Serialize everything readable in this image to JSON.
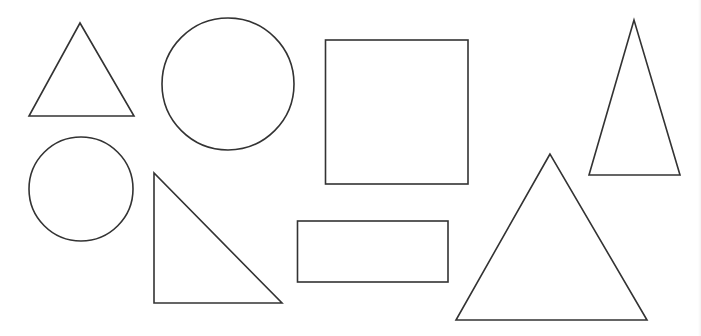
{
  "diagram": {
    "title": "",
    "style": {
      "stroke_color": "#333333",
      "background_color": "#ffffff"
    },
    "shapes": [
      {
        "id": "triangle-small-top-left",
        "kind": "triangle",
        "variant": "equilateral"
      },
      {
        "id": "circle-large-top",
        "kind": "circle"
      },
      {
        "id": "square-top-center",
        "kind": "square"
      },
      {
        "id": "triangle-tall-right",
        "kind": "triangle",
        "variant": "isosceles"
      },
      {
        "id": "circle-small-left",
        "kind": "circle"
      },
      {
        "id": "triangle-right-angle",
        "kind": "triangle",
        "variant": "right"
      },
      {
        "id": "rectangle-bottom-center",
        "kind": "rectangle"
      },
      {
        "id": "triangle-large-bottom-right",
        "kind": "triangle",
        "variant": "equilateral"
      }
    ]
  }
}
